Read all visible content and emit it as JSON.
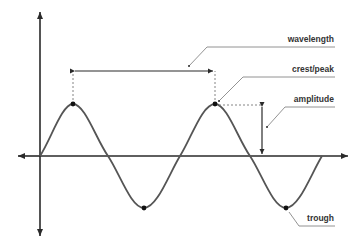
{
  "diagram": {
    "colors": {
      "axis": "#2a2a2a",
      "wave": "#555555",
      "point": "#111111",
      "guide": "#777777",
      "leader": "#777777",
      "text": "#333333"
    },
    "labels": {
      "wavelength": "wavelength",
      "crest": "crest/peak",
      "amplitude": "amplitude",
      "trough": "trough"
    },
    "wave": {
      "type": "sine",
      "cycles": 2,
      "points": {
        "crest_1": [
          73,
          104
        ],
        "trough_1": [
          145,
          208
        ],
        "crest_2": [
          215,
          104
        ],
        "trough_2": [
          286,
          208
        ]
      }
    }
  }
}
